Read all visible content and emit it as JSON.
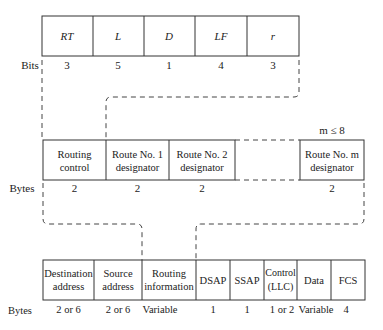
{
  "top_frame": {
    "unit_label": "Bits",
    "fields": [
      {
        "label": "RT",
        "size": "3"
      },
      {
        "label": "L",
        "size": "5"
      },
      {
        "label": "D",
        "size": "1"
      },
      {
        "label": "LF",
        "size": "4"
      },
      {
        "label": "r",
        "size": "3"
      }
    ]
  },
  "middle_frame": {
    "unit_label": "Bytes",
    "annotation": "m ≤ 8",
    "fields": [
      {
        "line1": "Routing",
        "line2": "control",
        "size": "2"
      },
      {
        "line1": "Route No. 1",
        "line2": "designator",
        "size": "2"
      },
      {
        "line1": "Route No. 2",
        "line2": "designator",
        "size": "2"
      },
      {
        "line1": "Route No. m",
        "line2": "designator",
        "size": "2"
      }
    ]
  },
  "bottom_frame": {
    "unit_label": "Bytes",
    "fields": [
      {
        "line1": "Destination",
        "line2": "address",
        "size": "2 or 6"
      },
      {
        "line1": "Source",
        "line2": "address",
        "size": "2 or 6"
      },
      {
        "line1": "Routing",
        "line2": "information",
        "size": "Variable"
      },
      {
        "line1": "DSAP",
        "line2": "",
        "size": "1"
      },
      {
        "line1": "SSAP",
        "line2": "",
        "size": "1"
      },
      {
        "line1": "Control",
        "line2": "(LLC)",
        "size": "1 or 2"
      },
      {
        "line1": "Data",
        "line2": "",
        "size": "Variable"
      },
      {
        "line1": "FCS",
        "line2": "",
        "size": "4"
      }
    ]
  }
}
